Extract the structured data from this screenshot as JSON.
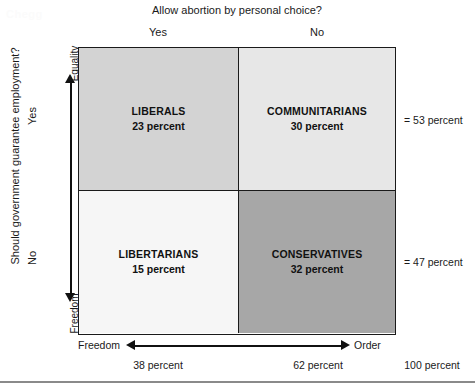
{
  "watermark": "Chegg",
  "columns": {
    "title": "Allow abortion by personal choice?",
    "heads": [
      "Yes",
      "No"
    ]
  },
  "rows": {
    "title": "Should government guarantee employment?",
    "heads": [
      "Yes",
      "No"
    ]
  },
  "axes": {
    "vertical": {
      "top": "Equality",
      "bottom": "Freedom"
    },
    "horizontal": {
      "left": "Freedom",
      "right": "Order"
    }
  },
  "cells": {
    "top_left": {
      "name": "LIBERALS",
      "value": "23 percent"
    },
    "top_right": {
      "name": "COMMUNITARIANS",
      "value": "30 percent"
    },
    "bottom_left": {
      "name": "LIBERTARIANS",
      "value": "15 percent"
    },
    "bottom_right": {
      "name": "CONSERVATIVES",
      "value": "32 percent"
    }
  },
  "row_totals": [
    "= 53 percent",
    "= 47 percent"
  ],
  "col_totals": [
    "38 percent",
    "62 percent",
    "100 percent"
  ],
  "colors": {
    "top_left": "#d3d3d3",
    "top_right": "#e7e7e7",
    "bottom_left": "#f6f6f6",
    "bottom_right": "#a7a7a7",
    "border": "#1a1a1a",
    "rule": "#8a8a8a"
  },
  "chart_data": {
    "type": "heatmap",
    "title": "Allow abortion by personal choice?",
    "xlabel": "Allow abortion by personal choice?",
    "ylabel": "Should government guarantee employment?",
    "x_categories": [
      "Yes",
      "No"
    ],
    "y_categories": [
      "Yes",
      "No"
    ],
    "x_axis_poles": [
      "Freedom",
      "Order"
    ],
    "y_axis_poles": [
      "Freedom",
      "Equality"
    ],
    "cells": [
      {
        "row": "Yes",
        "col": "Yes",
        "label": "LIBERALS",
        "value": 23,
        "unit": "percent",
        "color": "#d3d3d3"
      },
      {
        "row": "Yes",
        "col": "No",
        "label": "COMMUNITARIANS",
        "value": 30,
        "unit": "percent",
        "color": "#e7e7e7"
      },
      {
        "row": "No",
        "col": "Yes",
        "label": "LIBERTARIANS",
        "value": 15,
        "unit": "percent",
        "color": "#f6f6f6"
      },
      {
        "row": "No",
        "col": "No",
        "label": "CONSERVATIVES",
        "value": 32,
        "unit": "percent",
        "color": "#a7a7a7"
      }
    ],
    "row_totals": [
      53,
      47
    ],
    "col_totals": [
      38,
      62
    ],
    "grand_total": 100,
    "grid": true,
    "legend": false
  }
}
